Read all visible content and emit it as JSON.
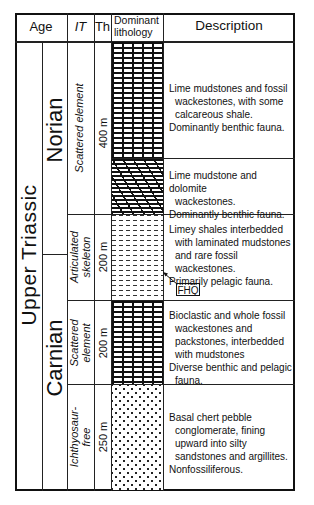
{
  "header": {
    "age": "Age",
    "it": "IT",
    "th": "Th",
    "lithology_line1": "Dominant",
    "lithology_line2": "lithology",
    "description": "Description"
  },
  "age": {
    "period": "Upper Triassic",
    "stages": [
      {
        "name": "Norian"
      },
      {
        "name": "Carnian"
      }
    ]
  },
  "units": [
    {
      "it_line1": "Scattered element",
      "it_line2": "",
      "thickness": "400 m",
      "lithology": "lime mudstone (brick pattern)",
      "description": [
        "Lime mudstones and fossil",
        "wackestones, with some",
        "calcareous shale.",
        "Dominantly benthic fauna."
      ]
    },
    {
      "lithology": "dolomite wackestone (slanted brick pattern)",
      "description": [
        "Lime mudstone and dolomite",
        "wackestones.",
        "Dominantly benthic fauna."
      ]
    },
    {
      "it_line1": "Articulated",
      "it_line2": "skeleton",
      "thickness": "200 m",
      "lithology": "limey shale (dashed pattern)",
      "description": [
        "Limey shales interbedded",
        "with laminated mudstones",
        "and rare fossil wackestones.",
        "Primarily pelagic fauna."
      ],
      "marker": "FHQ"
    },
    {
      "it_line1": "Scattered",
      "it_line2": "element",
      "thickness": "200 m",
      "lithology": "bioclastic limestone (brick pattern)",
      "description": [
        "Bioclastic and  whole fossil",
        "wackestones and",
        "packstones, interbedded",
        "with mudstones",
        "Diverse benthic and pelagic",
        "fauna."
      ]
    },
    {
      "it_line1": "Ichthyosaur-",
      "it_line2": "free",
      "thickness": "250 m",
      "lithology": "sandstone / conglomerate (dot pattern)",
      "description": [
        "Basal chert pebble",
        "conglomerate, fining",
        "upward into silty",
        "sandstones and argillites.",
        "Nonfossiliferous."
      ]
    }
  ]
}
